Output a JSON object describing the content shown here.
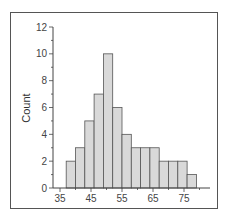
{
  "chart_data": {
    "type": "bar",
    "title": "",
    "xlabel": "",
    "ylabel": "Count",
    "bin_edges": [
      37,
      40,
      43,
      46,
      49,
      52,
      55,
      58,
      61,
      64,
      67,
      70,
      73,
      76,
      79
    ],
    "values": [
      2,
      3,
      5,
      7,
      10,
      6,
      4,
      3,
      3,
      3,
      2,
      2,
      2,
      1
    ],
    "xticks": [
      35,
      45,
      55,
      65,
      75
    ],
    "yticks": [
      0,
      2,
      4,
      6,
      8,
      10,
      12
    ],
    "xlim": [
      34,
      82
    ],
    "ylim": [
      0,
      12
    ],
    "grid": false,
    "bar_color": "#d9d9d9",
    "edge_color": "#555555"
  }
}
